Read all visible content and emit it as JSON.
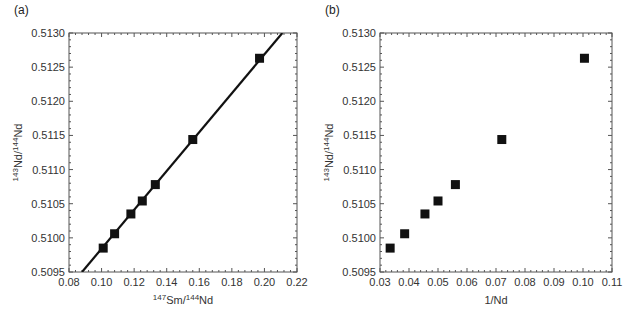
{
  "chart_data": [
    {
      "type": "scatter",
      "panel_label": "(a)",
      "xlabel": "147Sm/144Nd",
      "xlabel_parts": {
        "sup1": "147",
        "base1": "Sm/",
        "sup2": "144",
        "base2": "Nd"
      },
      "ylabel": "143Nd/144Nd",
      "ylabel_parts": {
        "sup1": "143",
        "base1": "Nd/",
        "sup2": "144",
        "base2": "Nd"
      },
      "xlim": [
        0.08,
        0.22
      ],
      "ylim": [
        0.5095,
        0.513
      ],
      "xticks": [
        "0.08",
        "0.10",
        "0.12",
        "0.14",
        "0.16",
        "0.18",
        "0.20",
        "0.22"
      ],
      "yticks": [
        "0.5095",
        "0.5100",
        "0.5105",
        "0.5110",
        "0.5115",
        "0.5120",
        "0.5125",
        "0.5130"
      ],
      "grid": false,
      "marker": "square",
      "x": [
        0.101,
        0.108,
        0.118,
        0.125,
        0.133,
        0.156,
        0.197
      ],
      "y": [
        0.50985,
        0.51006,
        0.51035,
        0.51054,
        0.51078,
        0.51144,
        0.51263
      ],
      "fit_line": {
        "x": [
          0.088,
          0.211
        ],
        "y": [
          0.5095,
          0.513
        ]
      }
    },
    {
      "type": "scatter",
      "panel_label": "(b)",
      "xlabel": "1/Nd",
      "ylabel": "143Nd/144Nd",
      "ylabel_parts": {
        "sup1": "143",
        "base1": "Nd/",
        "sup2": "144",
        "base2": "Nd"
      },
      "xlim": [
        0.03,
        0.11
      ],
      "ylim": [
        0.5095,
        0.513
      ],
      "xticks": [
        "0.03",
        "0.04",
        "0.05",
        "0.06",
        "0.07",
        "0.08",
        "0.09",
        "0.10",
        "0.11"
      ],
      "yticks": [
        "0.5095",
        "0.5100",
        "0.5105",
        "0.5110",
        "0.5115",
        "0.5120",
        "0.5125",
        "0.5130"
      ],
      "grid": false,
      "marker": "square",
      "x": [
        0.0335,
        0.0385,
        0.0455,
        0.05,
        0.056,
        0.072,
        0.1005
      ],
      "y": [
        0.50985,
        0.51006,
        0.51035,
        0.51054,
        0.51078,
        0.51144,
        0.51263
      ]
    }
  ],
  "panels": {
    "a": {
      "label": "(a)"
    },
    "b": {
      "label": "(b)",
      "xlabel": "1/Nd"
    }
  },
  "colors": {
    "marker": "#111111",
    "axis": "#555555",
    "line": "#111111"
  }
}
